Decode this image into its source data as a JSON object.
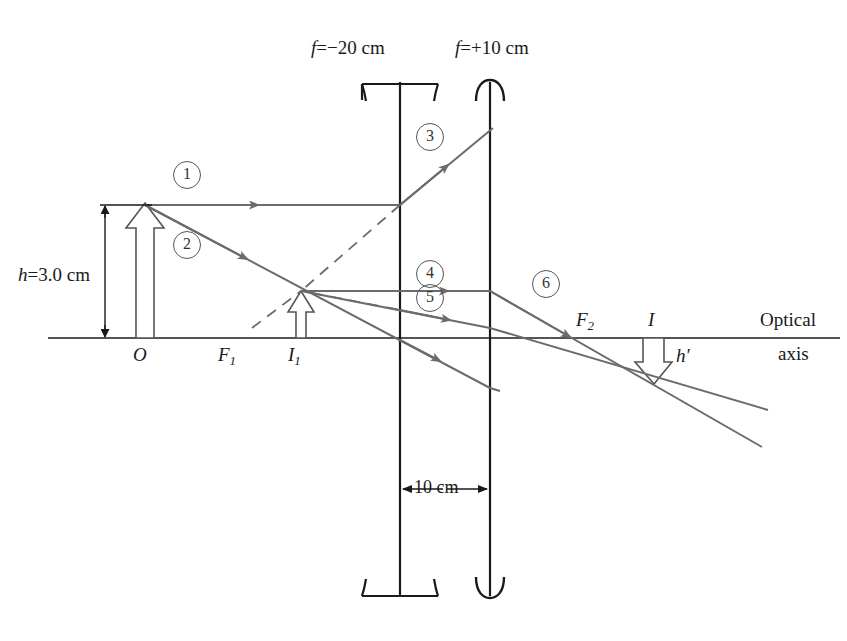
{
  "figure": {
    "type": "optics-ray-diagram"
  },
  "lenses": [
    {
      "id": "lens-1",
      "kind": "diverging",
      "focal_label": "f = −20 cm",
      "x": 400
    },
    {
      "id": "lens-2",
      "kind": "converging",
      "focal_label": "f = +10 cm",
      "x": 490
    }
  ],
  "labels": {
    "f1_lens": "f",
    "f1_eq": "=",
    "f1_val": "−20 cm",
    "f2_lens": "f",
    "f2_eq": "=",
    "f2_val": "+10 cm",
    "object_height": "h",
    "object_height_eq": "=",
    "object_height_val": "3.0 cm",
    "object_point": "O",
    "focal_point_1": "F",
    "focal_point_1_sub": "1",
    "image_1": "I",
    "image_1_sub": "1",
    "focal_point_2": "F",
    "focal_point_2_sub": "2",
    "image_final": "I",
    "image_height": "h",
    "image_height_prime": "′",
    "separation": "10 cm",
    "axis_line1": "Optical",
    "axis_line2": "axis"
  },
  "ray_numbers": [
    {
      "n": "1",
      "x": 186,
      "y": 174
    },
    {
      "n": "2",
      "x": 186,
      "y": 244
    },
    {
      "n": "3",
      "x": 429,
      "y": 136
    },
    {
      "n": "4",
      "x": 429,
      "y": 273
    },
    {
      "n": "5",
      "x": 429,
      "y": 297
    },
    {
      "n": "6",
      "x": 545,
      "y": 283
    }
  ],
  "colors": {
    "ray": "#6b6b6b",
    "structure": "#1a1a1a",
    "axis": "#555555",
    "text": "#1a1a1a"
  },
  "geometry": {
    "axis_y": 338,
    "axis_x_start": 48,
    "axis_x_end": 840,
    "object_x": 140,
    "object_top_y": 205,
    "image1_x": 300,
    "image1_top_y": 291,
    "image_final_x": 655,
    "image_final_bottom_y": 383
  }
}
